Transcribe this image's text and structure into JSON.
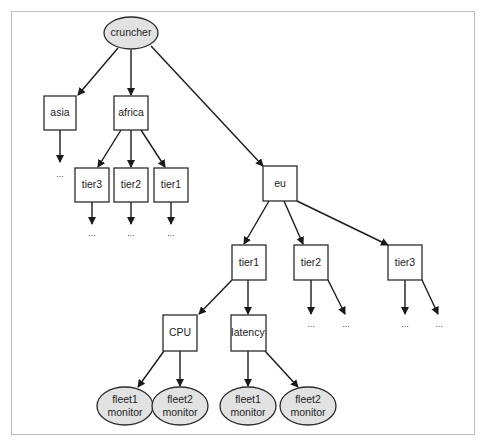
{
  "diagram": {
    "root": {
      "id": "cruncher",
      "label": "cruncher",
      "shape": "ellipse"
    },
    "nodes": [
      {
        "id": "asia",
        "label": "asia",
        "shape": "box"
      },
      {
        "id": "africa",
        "label": "africa",
        "shape": "box"
      },
      {
        "id": "africa_tier3",
        "label": "tier3",
        "shape": "box"
      },
      {
        "id": "africa_tier2",
        "label": "tier2",
        "shape": "box"
      },
      {
        "id": "africa_tier1",
        "label": "tier1",
        "shape": "box"
      },
      {
        "id": "eu",
        "label": "eu",
        "shape": "box"
      },
      {
        "id": "eu_tier1",
        "label": "tier1",
        "shape": "box"
      },
      {
        "id": "eu_tier2",
        "label": "tier2",
        "shape": "box"
      },
      {
        "id": "eu_tier3",
        "label": "tier3",
        "shape": "box"
      },
      {
        "id": "cpu",
        "label": "CPU",
        "shape": "box"
      },
      {
        "id": "latency",
        "label": "latency",
        "shape": "box"
      },
      {
        "id": "cpu_fleet1",
        "label_line1": "fleet1",
        "label_line2": "monitor",
        "shape": "ellipse"
      },
      {
        "id": "cpu_fleet2",
        "label_line1": "fleet2",
        "label_line2": "monitor",
        "shape": "ellipse"
      },
      {
        "id": "lat_fleet1",
        "label_line1": "fleet1",
        "label_line2": "monitor",
        "shape": "ellipse"
      },
      {
        "id": "lat_fleet2",
        "label_line1": "fleet2",
        "label_line2": "monitor",
        "shape": "ellipse"
      }
    ],
    "ellipsis": "...",
    "edges": [
      [
        "cruncher",
        "asia"
      ],
      [
        "cruncher",
        "africa"
      ],
      [
        "cruncher",
        "eu"
      ],
      [
        "asia",
        "..."
      ],
      [
        "africa",
        "africa_tier3"
      ],
      [
        "africa",
        "africa_tier2"
      ],
      [
        "africa",
        "africa_tier1"
      ],
      [
        "africa_tier3",
        "..."
      ],
      [
        "africa_tier2",
        "..."
      ],
      [
        "africa_tier1",
        "..."
      ],
      [
        "eu",
        "eu_tier1"
      ],
      [
        "eu",
        "eu_tier2"
      ],
      [
        "eu",
        "eu_tier3"
      ],
      [
        "eu_tier1",
        "cpu"
      ],
      [
        "eu_tier1",
        "latency"
      ],
      [
        "eu_tier2",
        "..."
      ],
      [
        "eu_tier2",
        "..."
      ],
      [
        "eu_tier3",
        "..."
      ],
      [
        "eu_tier3",
        "..."
      ],
      [
        "cpu",
        "cpu_fleet1"
      ],
      [
        "cpu",
        "cpu_fleet2"
      ],
      [
        "latency",
        "lat_fleet1"
      ],
      [
        "latency",
        "lat_fleet2"
      ]
    ]
  }
}
